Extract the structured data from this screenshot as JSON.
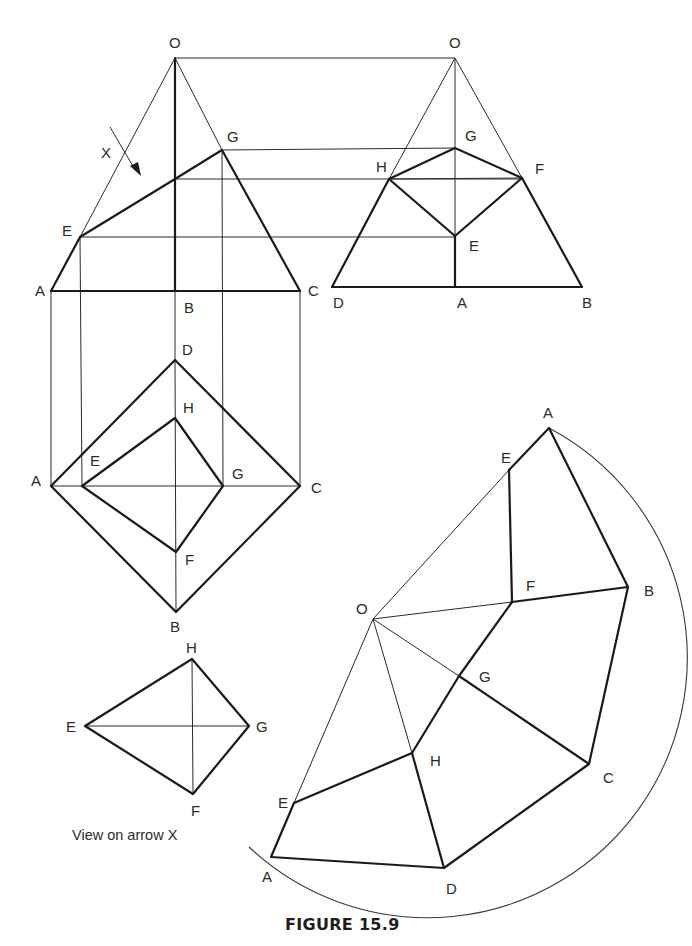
{
  "figure": {
    "caption": "FIGURE 15.9",
    "view_on_arrow_caption": "View on arrow X",
    "arrow_label": "X"
  },
  "front_elevation": {
    "labels": {
      "O": "O",
      "G": "G",
      "E": "E",
      "A": "A",
      "B": "B",
      "C": "C"
    }
  },
  "side_elevation": {
    "labels": {
      "O": "O",
      "G": "G",
      "H": "H",
      "F": "F",
      "E": "E",
      "D": "D",
      "A": "A",
      "B": "B"
    }
  },
  "plan": {
    "labels": {
      "D": "D",
      "H": "H",
      "A": "A",
      "E": "E",
      "G": "G",
      "C": "C",
      "F": "F",
      "B": "B"
    }
  },
  "arrow_view": {
    "labels": {
      "H": "H",
      "E": "E",
      "G": "G",
      "F": "F"
    }
  },
  "development": {
    "labels": {
      "A_top": "A",
      "E_top": "E",
      "F": "F",
      "B": "B",
      "O": "O",
      "G": "G",
      "H": "H",
      "C": "C",
      "E_bottom": "E",
      "A_bottom": "A",
      "D": "D"
    }
  },
  "colors": {
    "line": "#1a1a1a",
    "background": "#ffffff"
  }
}
